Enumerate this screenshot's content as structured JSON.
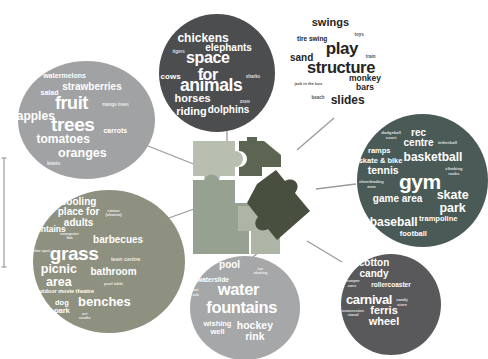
{
  "clusters": [
    {
      "name": "fruit trees",
      "color": "#a1a2a4",
      "text_color": "#ffffff",
      "words": [
        "watermelons",
        "strawberries",
        "salad",
        "fruit",
        "mango trees",
        "apples",
        "trees",
        "carrots",
        "tomatoes",
        "oranges",
        "kiwis"
      ]
    },
    {
      "name": "space for animals",
      "color": "#4c4d4f",
      "text_color": "#ffffff",
      "words": [
        "chickens",
        "elephants",
        "tigers",
        "space for",
        "cows",
        "sharks",
        "animals",
        "horses",
        "zoo",
        "riding",
        "dolphins"
      ]
    },
    {
      "name": "play structure",
      "color": "transparent",
      "text_color": "#252525",
      "words": [
        "swings",
        "toys",
        "tire swing",
        "play",
        "sand",
        "train",
        "structure",
        "monkey\nbars",
        "jack in the box",
        "beach",
        "slides"
      ]
    },
    {
      "name": "gym",
      "color": "#4a5a57",
      "text_color": "#ffffff",
      "words": [
        "rec\ncentre",
        "dodgeball\ncourt",
        "tetherball",
        "ramps",
        "basketball",
        "skate & bike",
        "tennis",
        "climbing\nrocks",
        "gym",
        "cheerleading\narea",
        "game area",
        "skate\npark",
        "baseball",
        "trampoline",
        "football"
      ]
    },
    {
      "name": "grass",
      "color": "#8f9180",
      "text_color": "#ffffff",
      "words": [
        "cooling\nplace for\nadults",
        "statue\n(obama)",
        "fountains",
        "computer\nlab",
        "barbecues",
        "relax spot",
        "grass",
        "teen centre",
        "picnic\narea",
        "bathroom",
        "pool table",
        "outdoor movie theatre",
        "dog\npark",
        "benches",
        "art\nstudio"
      ]
    },
    {
      "name": "water fountains",
      "color": "#a6a7a9",
      "text_color": "#ffffff",
      "words": [
        "pool",
        "ice\nskating",
        "waterslide",
        "hot\ntub",
        "water",
        "fountains",
        "wishing\nwell",
        "hockey\nrink"
      ]
    },
    {
      "name": "carnival",
      "color": "#59595b",
      "text_color": "#ffffff",
      "words": [
        "cotton\ncandy",
        "bumper\ncars",
        "rollercoaster",
        "carnival",
        "candy\nstore",
        "concession\nstand",
        "ferris\nwheel"
      ]
    }
  ],
  "center_graphic": {
    "icon": "jigsaw-puzzle-pulled-piece",
    "colors": {
      "light": "#b8bfb1",
      "dark": "#5c6452",
      "medium": "#97a191",
      "light2": "#aeb5a6",
      "pulled": "#484f3e"
    }
  },
  "connector_color": "#9b9b9b"
}
